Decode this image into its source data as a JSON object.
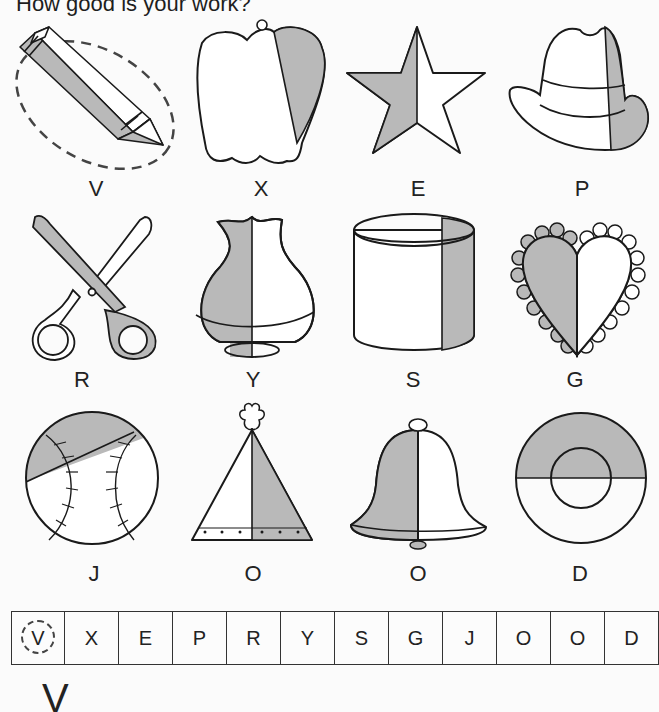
{
  "title": "How good is your work?",
  "colors": {
    "shade": "#b9b9b9",
    "ink": "#1a1a1a",
    "paper": "#fbfbfb"
  },
  "pictures": [
    {
      "name": "crayon",
      "letter": "V",
      "circled": true
    },
    {
      "name": "bell-pepper",
      "letter": "X"
    },
    {
      "name": "star",
      "letter": "E"
    },
    {
      "name": "hat",
      "letter": "P"
    },
    {
      "name": "scissors",
      "letter": "R"
    },
    {
      "name": "vase",
      "letter": "Y"
    },
    {
      "name": "cylinder",
      "letter": "S"
    },
    {
      "name": "heart",
      "letter": "G"
    },
    {
      "name": "baseball",
      "letter": "J"
    },
    {
      "name": "party-hat",
      "letter": "O"
    },
    {
      "name": "bell",
      "letter": "O"
    },
    {
      "name": "ring",
      "letter": "D"
    }
  ],
  "answer_row": [
    "V",
    "X",
    "E",
    "P",
    "R",
    "Y",
    "S",
    "G",
    "J",
    "O",
    "O",
    "D"
  ],
  "written_letter": "V"
}
